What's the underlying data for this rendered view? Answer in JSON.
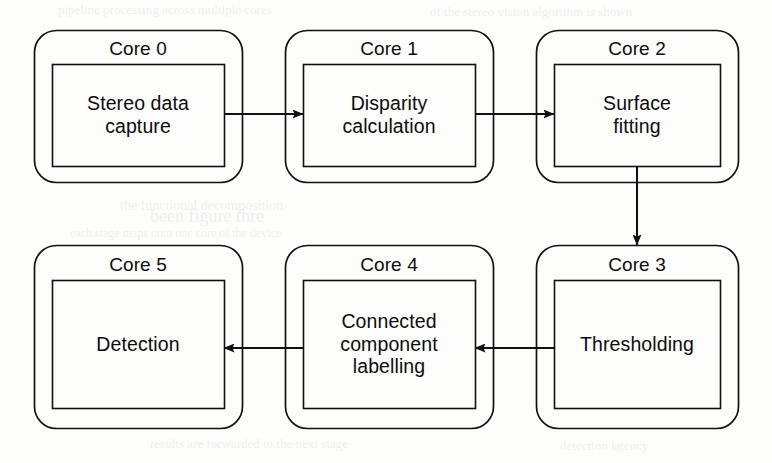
{
  "diagram": {
    "type": "flowchart",
    "orientation": "serpentine-two-rows",
    "stroke_color": "#111111",
    "background_color": "#fdfdfc",
    "nodes": [
      {
        "id": "core0",
        "title": "Core 0",
        "body": "Stereo data\ncapture",
        "body_lines": [
          "Stereo data",
          "capture"
        ],
        "row": 0,
        "column": 0,
        "outer": {
          "x": 34,
          "y": 30,
          "w": 208,
          "h": 152,
          "r": 22
        },
        "inner": {
          "x": 52,
          "y": 64,
          "w": 172,
          "h": 102
        }
      },
      {
        "id": "core1",
        "title": "Core 1",
        "body": "Disparity\ncalculation",
        "body_lines": [
          "Disparity",
          "calculation"
        ],
        "row": 0,
        "column": 1,
        "outer": {
          "x": 285,
          "y": 30,
          "w": 208,
          "h": 152,
          "r": 22
        },
        "inner": {
          "x": 303,
          "y": 64,
          "w": 172,
          "h": 102
        }
      },
      {
        "id": "core2",
        "title": "Core 2",
        "body": "Surface\nfitting",
        "body_lines": [
          "Surface",
          "fitting"
        ],
        "row": 0,
        "column": 2,
        "outer": {
          "x": 536,
          "y": 30,
          "w": 202,
          "h": 152,
          "r": 22
        },
        "inner": {
          "x": 554,
          "y": 64,
          "w": 166,
          "h": 102
        }
      },
      {
        "id": "core3",
        "title": "Core 3",
        "body": "Thresholding",
        "body_lines": [
          "Thresholding"
        ],
        "row": 1,
        "column": 2,
        "outer": {
          "x": 536,
          "y": 245,
          "w": 202,
          "h": 183,
          "r": 22
        },
        "inner": {
          "x": 554,
          "y": 280,
          "w": 166,
          "h": 128
        }
      },
      {
        "id": "core4",
        "title": "Core 4",
        "body": "Connected\ncomponent\nlabelling",
        "body_lines": [
          "Connected",
          "component",
          "labelling"
        ],
        "row": 1,
        "column": 1,
        "outer": {
          "x": 285,
          "y": 245,
          "w": 208,
          "h": 183,
          "r": 22
        },
        "inner": {
          "x": 303,
          "y": 280,
          "w": 172,
          "h": 128
        }
      },
      {
        "id": "core5",
        "title": "Core 5",
        "body": "Detection",
        "body_lines": [
          "Detection"
        ],
        "row": 1,
        "column": 0,
        "outer": {
          "x": 34,
          "y": 245,
          "w": 208,
          "h": 183,
          "r": 22
        },
        "inner": {
          "x": 52,
          "y": 280,
          "w": 172,
          "h": 128
        }
      }
    ],
    "edges": [
      {
        "id": "e0",
        "from": "core0",
        "to": "core1",
        "direction": "right",
        "x1": 224,
        "y1": 114,
        "x2": 303,
        "y2": 114
      },
      {
        "id": "e1",
        "from": "core1",
        "to": "core2",
        "direction": "right",
        "x1": 475,
        "y1": 114,
        "x2": 554,
        "y2": 114
      },
      {
        "id": "e2",
        "from": "core2",
        "to": "core3",
        "direction": "down",
        "x1": 637,
        "y1": 166,
        "x2": 637,
        "y2": 245
      },
      {
        "id": "e3",
        "from": "core3",
        "to": "core4",
        "direction": "left",
        "x1": 554,
        "y1": 348,
        "x2": 475,
        "y2": 348
      },
      {
        "id": "e4",
        "from": "core4",
        "to": "core5",
        "direction": "left",
        "x1": 303,
        "y1": 348,
        "x2": 224,
        "y2": 348
      }
    ]
  },
  "bleed_text": [
    {
      "text": "pipeline processing across multiple cores",
      "x": 58,
      "y": 2,
      "size": 13
    },
    {
      "text": "of the stereo vision algorithm is shown",
      "x": 430,
      "y": 4,
      "size": 13
    },
    {
      "text": "the functional decomposition",
      "x": 120,
      "y": 198,
      "size": 14
    },
    {
      "text": "been figure thre",
      "x": 150,
      "y": 206,
      "size": 18
    },
    {
      "text": "each stage maps onto one core of the device",
      "x": 70,
      "y": 226,
      "size": 12
    },
    {
      "text": "results are forwarded to the next stage",
      "x": 150,
      "y": 436,
      "size": 13
    },
    {
      "text": "detection latency",
      "x": 560,
      "y": 438,
      "size": 13
    }
  ]
}
